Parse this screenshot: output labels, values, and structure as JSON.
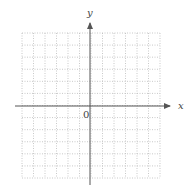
{
  "chart_data": {
    "type": "grid",
    "title": "",
    "xlabel": "x",
    "ylabel": "y",
    "origin_label": "0",
    "grid": true,
    "grid_style": "dotted",
    "columns": 12,
    "rows": 12,
    "xlim": [
      -6,
      6
    ],
    "ylim": [
      -6,
      6
    ],
    "data": []
  },
  "colors": {
    "axis": "#555555",
    "grid": "#bbbbbb",
    "background": "#ffffff"
  }
}
